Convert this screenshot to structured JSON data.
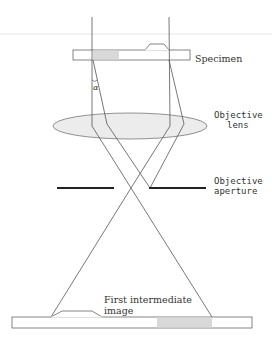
{
  "diagram": {
    "type": "optical ray diagram",
    "labels": {
      "specimen": "Specimen",
      "objective_lens_line1": "Objective",
      "objective_lens_line2": "lens",
      "objective_aperture_line1": "Objective",
      "objective_aperture_line2": "aperture",
      "image_line1": "First intermediate",
      "image_line2": "image",
      "angle": "α"
    },
    "colors": {
      "line": "#555555",
      "specimen_shade": "#d9d9d9",
      "lens_fill": "#ececec",
      "aperture": "#222222",
      "separator": "#e6e6e6"
    }
  }
}
